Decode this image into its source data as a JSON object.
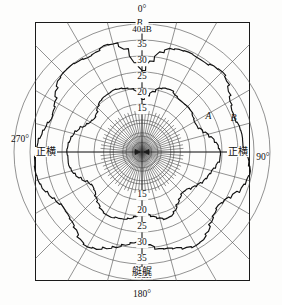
{
  "figure": {
    "kind": "polar-directivity-diagram",
    "bm_label": "B",
    "bm_subscript": "m",
    "background": "#fdfdfc",
    "ink": "#1a1a1a"
  },
  "angles": {
    "top": "0°",
    "right": "90°",
    "bottom": "180°",
    "left": "270°"
  },
  "side_labels": {
    "left": "正横",
    "right": "正横",
    "bottom_inner": "艇艉"
  },
  "scale": {
    "unit": "dB",
    "max_label": "40dB",
    "top_ticks": [
      "40dB",
      "35",
      "30",
      "25",
      "20",
      "15"
    ],
    "bottom_ticks": [
      "15",
      "20",
      "25",
      "30",
      "35",
      "40dB"
    ],
    "ring_values": [
      40,
      35,
      30,
      25,
      20,
      15,
      10,
      5,
      0
    ],
    "radial_spacing_deg": 15
  },
  "curves": [
    {
      "name": "A",
      "label": "A",
      "style": "jagged-inner"
    },
    {
      "name": "B",
      "label": "B",
      "style": "jagged-outer"
    }
  ],
  "chart_data": {
    "type": "line",
    "subtype": "polar",
    "title": "",
    "xlabel": "",
    "ylabel": "dB",
    "rlim": [
      0,
      40
    ],
    "rticks": [
      15,
      20,
      25,
      30,
      35,
      40
    ],
    "rtick_labels": [
      "15",
      "20",
      "25",
      "30",
      "35",
      "40dB"
    ],
    "theta_zero_location": "N",
    "theta_direction": "clockwise",
    "theta_ticks_deg": [
      0,
      15,
      30,
      45,
      60,
      75,
      90,
      105,
      120,
      135,
      150,
      165,
      180,
      195,
      210,
      225,
      240,
      255,
      270,
      285,
      300,
      315,
      330,
      345
    ],
    "theta_tick_labels": [
      "0°",
      "",
      "",
      "",
      "",
      "",
      "90°",
      "",
      "",
      "",
      "",
      "",
      "180°",
      "",
      "",
      "",
      "",
      "",
      "270°",
      "",
      "",
      "",
      "",
      ""
    ],
    "grid": true,
    "legend": "inline-annotations",
    "annotations": [
      {
        "text": "A",
        "theta_deg": 62,
        "r": 24
      },
      {
        "text": "B",
        "theta_deg": 70,
        "r": 31
      },
      {
        "text": "正横",
        "theta_deg": 270,
        "r": 31
      },
      {
        "text": "正横",
        "theta_deg": 90,
        "r": 31
      },
      {
        "text": "艇艉",
        "theta_deg": 180,
        "r": 38
      }
    ],
    "series": [
      {
        "name": "B",
        "theta_deg": [
          0,
          5,
          10,
          15,
          20,
          25,
          30,
          35,
          40,
          45,
          50,
          55,
          60,
          65,
          70,
          75,
          80,
          85,
          90,
          95,
          100,
          105,
          110,
          115,
          120,
          125,
          130,
          135,
          140,
          145,
          150,
          155,
          160,
          165,
          170,
          175,
          180,
          185,
          190,
          195,
          200,
          205,
          210,
          215,
          220,
          225,
          230,
          235,
          240,
          245,
          250,
          255,
          260,
          265,
          270,
          275,
          280,
          285,
          290,
          295,
          300,
          305,
          310,
          315,
          320,
          325,
          330,
          335,
          340,
          345,
          350,
          355
        ],
        "values": [
          25.5,
          28,
          31,
          33,
          34,
          34.5,
          34,
          33.5,
          34,
          34.5,
          34,
          33,
          32,
          31,
          30.5,
          31,
          31.5,
          32,
          33.5,
          34.5,
          35,
          34,
          33,
          31.5,
          30.5,
          30,
          30.5,
          31,
          32,
          33,
          33.5,
          33,
          32,
          31,
          30,
          28,
          26.5,
          28,
          29.5,
          31,
          32,
          33,
          33.5,
          33,
          32,
          31.5,
          31,
          30.5,
          31,
          32,
          33.5,
          34.5,
          35,
          34.5,
          33.5,
          32.5,
          31.5,
          31,
          30.5,
          31,
          31.5,
          32.5,
          33.5,
          34,
          34.5,
          34.5,
          34,
          34,
          34.5,
          34,
          32,
          28
        ]
      },
      {
        "name": "A",
        "theta_deg": [
          0,
          5,
          10,
          15,
          20,
          25,
          30,
          35,
          40,
          45,
          50,
          55,
          60,
          65,
          70,
          75,
          80,
          85,
          90,
          95,
          100,
          105,
          110,
          115,
          120,
          125,
          130,
          135,
          140,
          145,
          150,
          155,
          160,
          165,
          170,
          175,
          180,
          185,
          190,
          195,
          200,
          205,
          210,
          215,
          220,
          225,
          230,
          235,
          240,
          245,
          250,
          255,
          260,
          265,
          270,
          275,
          280,
          285,
          290,
          295,
          300,
          305,
          310,
          315,
          320,
          325,
          330,
          335,
          340,
          345,
          350,
          355
        ],
        "values": [
          17.5,
          18.5,
          19.5,
          20.5,
          21,
          21.5,
          21,
          20.5,
          20,
          19.5,
          19,
          18.5,
          18.5,
          19,
          20,
          21,
          22,
          23,
          24,
          24.5,
          24,
          23,
          22,
          21,
          20,
          19.5,
          19,
          19,
          19.5,
          20,
          21,
          22,
          22.5,
          22,
          21,
          19.5,
          18.5,
          19.5,
          20.5,
          21.5,
          22,
          22.5,
          22,
          21,
          20,
          19.5,
          19,
          19,
          19.5,
          20.5,
          21.5,
          22.5,
          23.5,
          24,
          24.5,
          24,
          23,
          22,
          21,
          20,
          19.5,
          19,
          19,
          19.5,
          20,
          20.5,
          21,
          21.5,
          21,
          20,
          19,
          18
        ]
      }
    ]
  }
}
